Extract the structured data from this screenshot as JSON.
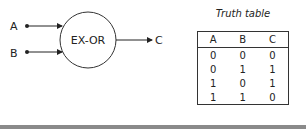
{
  "diagram": {
    "gate": {
      "label": "EX-OR"
    },
    "inputs": [
      {
        "label": "A"
      },
      {
        "label": "B"
      }
    ],
    "output": {
      "label": "C"
    }
  },
  "truth_table": {
    "title": "Truth table",
    "headers": [
      "A",
      "B",
      "C"
    ],
    "rows": [
      [
        "0",
        "0",
        "0"
      ],
      [
        "0",
        "1",
        "1"
      ],
      [
        "1",
        "0",
        "1"
      ],
      [
        "1",
        "1",
        "0"
      ]
    ]
  }
}
